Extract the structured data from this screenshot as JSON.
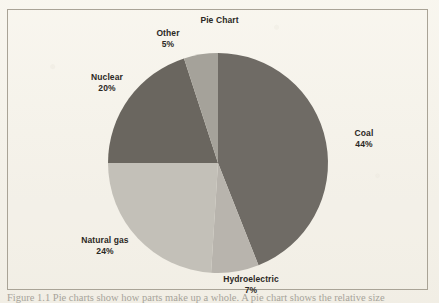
{
  "page": {
    "background_color": "#f3f0e8",
    "frame_color": "#a9a396"
  },
  "chart_data": {
    "type": "pie",
    "title": "Pie Chart",
    "categories": [
      "Coal",
      "Hydroelectric",
      "Natural gas",
      "Nuclear",
      "Other"
    ],
    "values": [
      44,
      7,
      24,
      20,
      5
    ],
    "unit": "%",
    "start_angle_deg": 0,
    "direction": "clockwise",
    "legend": "none",
    "labels_position": "outside",
    "slices": [
      {
        "name": "Coal",
        "percent": 44,
        "label": "Coal",
        "value_label": "44%",
        "color": "#6f6b65"
      },
      {
        "name": "Hydroelectric",
        "percent": 7,
        "label": "Hydroelectric",
        "value_label": "7%",
        "color": "#b8b4ad"
      },
      {
        "name": "Natural gas",
        "percent": 24,
        "label": "Natural gas",
        "value_label": "24%",
        "color": "#c3c0b8"
      },
      {
        "name": "Nuclear",
        "percent": 20,
        "label": "Nuclear",
        "value_label": "20%",
        "color": "#6a665f"
      },
      {
        "name": "Other",
        "percent": 5,
        "label": "Other",
        "value_label": "5%",
        "color": "#a5a29a"
      }
    ],
    "geometry": {
      "center_x": 218,
      "center_y": 163,
      "radius": 110
    }
  },
  "caption": {
    "text": "Figure 1.1   Pie charts show how parts make up a whole. A pie chart shows the relative size"
  }
}
